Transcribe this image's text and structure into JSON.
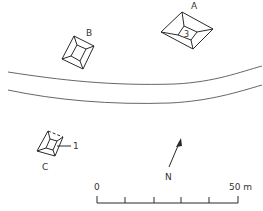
{
  "diagram": {
    "type": "site-plan",
    "structures": [
      {
        "id": "A",
        "label": "A",
        "inner_label": "3"
      },
      {
        "id": "B",
        "label": "B"
      },
      {
        "id": "C",
        "label": "C",
        "callout_label": "1"
      }
    ],
    "road": {
      "description": "curved road / path crossing the site"
    },
    "north_arrow": {
      "label": "N"
    },
    "scale_bar": {
      "start_label": "0",
      "end_label": "50 m",
      "divisions": 5
    },
    "colors": {
      "line": "#2a2a2a",
      "background": "#ffffff"
    }
  }
}
